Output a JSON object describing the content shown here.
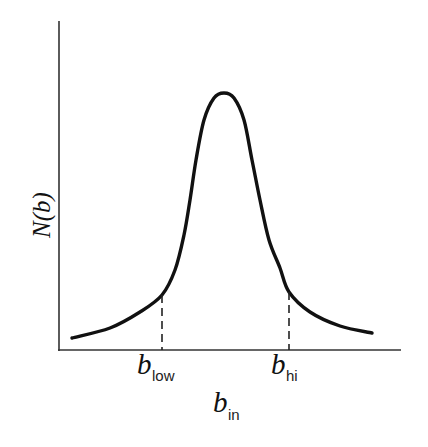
{
  "chart_data": {
    "type": "line",
    "title": "",
    "xlabel_main": "b",
    "xlabel_sub": "in",
    "ylabel": "N(b)",
    "grid": false,
    "legend": null,
    "ticks": {
      "x": [],
      "y": []
    },
    "series": [
      {
        "name": "N(b) distribution",
        "shape": "symmetric peaked (Lorentzian-like) curve",
        "points_px": [
          [
            72,
            338
          ],
          [
            110,
            328
          ],
          [
            140,
            312
          ],
          [
            162,
            295
          ],
          [
            175,
            270
          ],
          [
            184,
            235
          ],
          [
            190,
            200
          ],
          [
            196,
            160
          ],
          [
            204,
            120
          ],
          [
            214,
            98
          ],
          [
            224,
            93
          ],
          [
            234,
            98
          ],
          [
            244,
            120
          ],
          [
            252,
            160
          ],
          [
            260,
            200
          ],
          [
            269,
            240
          ],
          [
            280,
            268
          ],
          [
            289,
            292
          ],
          [
            310,
            312
          ],
          [
            340,
            326
          ],
          [
            372,
            333
          ]
        ],
        "color": "#111111"
      }
    ],
    "annotations": [
      {
        "type": "dashed-vline",
        "label_main": "b",
        "label_sub": "low",
        "x_px": 162,
        "y_top_px": 295
      },
      {
        "type": "dashed-vline",
        "label_main": "b",
        "label_sub": "hi",
        "x_px": 289,
        "y_top_px": 292
      }
    ]
  },
  "labels": {
    "y_axis": "N(b)",
    "x_axis_main": "b",
    "x_axis_sub": "in",
    "b_low_main": "b",
    "b_low_sub": "low",
    "b_hi_main": "b",
    "b_hi_sub": "hi"
  },
  "colors": {
    "line": "#111111",
    "axis": "#333333",
    "background": "#ffffff"
  }
}
